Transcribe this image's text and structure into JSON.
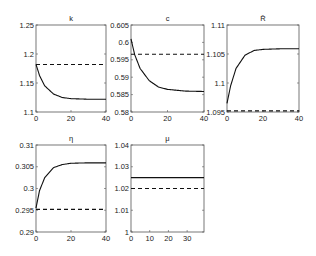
{
  "chart_data": [
    {
      "type": "line",
      "title": "k",
      "xlabel": "",
      "ylabel": "",
      "xlim": [
        0,
        40
      ],
      "ylim": [
        1.1,
        1.25
      ],
      "xticks": [
        "0",
        "20",
        "40"
      ],
      "yticks": [
        "1.1",
        "1.15",
        "1.2",
        "1.25"
      ],
      "grid": false,
      "series": [
        {
          "name": "transition",
          "style": "solid",
          "x": [
            0,
            2,
            5,
            10,
            15,
            20,
            30,
            40
          ],
          "values": [
            1.182,
            1.163,
            1.145,
            1.131,
            1.125,
            1.123,
            1.122,
            1.122
          ]
        },
        {
          "name": "initial steady state",
          "style": "dashed",
          "x": [
            0,
            40
          ],
          "values": [
            1.182,
            1.182
          ]
        }
      ]
    },
    {
      "type": "line",
      "title": "c",
      "xlabel": "",
      "ylabel": "",
      "xlim": [
        0,
        40
      ],
      "ylim": [
        0.58,
        0.605
      ],
      "xticks": [
        "0",
        "20",
        "40"
      ],
      "yticks": [
        "0.58",
        "0.585",
        "0.59",
        "0.595",
        "0.6",
        "0.605"
      ],
      "grid": false,
      "series": [
        {
          "name": "transition",
          "style": "solid",
          "x": [
            0,
            2,
            5,
            10,
            15,
            20,
            30,
            40
          ],
          "values": [
            0.601,
            0.5965,
            0.5925,
            0.589,
            0.5872,
            0.5865,
            0.586,
            0.5859
          ]
        },
        {
          "name": "initial steady state",
          "style": "dashed",
          "x": [
            0,
            40
          ],
          "values": [
            0.5966,
            0.5966
          ]
        }
      ]
    },
    {
      "type": "line",
      "title": "R̄",
      "xlabel": "",
      "ylabel": "",
      "xlim": [
        0,
        40
      ],
      "ylim": [
        1.095,
        1.11
      ],
      "xticks": [
        "0",
        "20",
        "40"
      ],
      "yticks": [
        "1.095",
        "1.1",
        "1.105",
        "1.11"
      ],
      "grid": false,
      "series": [
        {
          "name": "transition",
          "style": "solid",
          "x": [
            0,
            2,
            5,
            10,
            15,
            20,
            30,
            40
          ],
          "values": [
            1.0965,
            1.0995,
            1.1025,
            1.1048,
            1.1056,
            1.1058,
            1.1059,
            1.1059
          ]
        },
        {
          "name": "initial steady state",
          "style": "dashed",
          "x": [
            0,
            40
          ],
          "values": [
            1.0952,
            1.0952
          ]
        }
      ]
    },
    {
      "type": "line",
      "title": "η",
      "xlabel": "",
      "ylabel": "",
      "xlim": [
        0,
        40
      ],
      "ylim": [
        0.29,
        0.31
      ],
      "xticks": [
        "0",
        "20",
        "40"
      ],
      "yticks": [
        "0.29",
        "0.295",
        "0.3",
        "0.305",
        "0.31"
      ],
      "grid": false,
      "series": [
        {
          "name": "transition",
          "style": "solid",
          "x": [
            0,
            2,
            5,
            10,
            15,
            20,
            30,
            40
          ],
          "values": [
            0.2955,
            0.2995,
            0.3025,
            0.3048,
            0.3055,
            0.3058,
            0.3059,
            0.3059
          ]
        },
        {
          "name": "initial steady state",
          "style": "dashed",
          "x": [
            0,
            40
          ],
          "values": [
            0.2952,
            0.2952
          ]
        }
      ]
    },
    {
      "type": "line",
      "title": "μ",
      "xlabel": "",
      "ylabel": "",
      "xlim": [
        0,
        39
      ],
      "ylim": [
        1.0,
        1.04
      ],
      "xticks": [
        "0",
        "10",
        "20",
        "30"
      ],
      "yticks": [
        "1",
        "1.01",
        "1.02",
        "1.03",
        "1.04"
      ],
      "grid": false,
      "series": [
        {
          "name": "transition",
          "style": "solid",
          "x": [
            0,
            39
          ],
          "values": [
            1.025,
            1.025
          ]
        },
        {
          "name": "initial steady state",
          "style": "dashed",
          "x": [
            0,
            39
          ],
          "values": [
            1.02,
            1.02
          ]
        }
      ]
    }
  ],
  "layout": {
    "panels": [
      {
        "left": 36,
        "top": 25,
        "width": 70,
        "height": 87
      },
      {
        "left": 131,
        "top": 25,
        "width": 73,
        "height": 87
      },
      {
        "left": 227,
        "top": 25,
        "width": 72,
        "height": 87
      },
      {
        "left": 36,
        "top": 145,
        "width": 70,
        "height": 87
      },
      {
        "left": 131,
        "top": 145,
        "width": 73,
        "height": 87
      }
    ]
  }
}
